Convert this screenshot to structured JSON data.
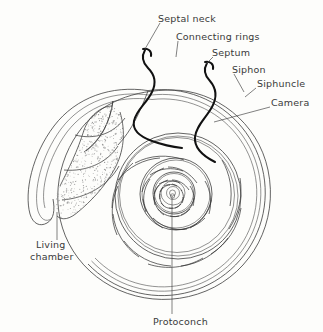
{
  "figure": {
    "background_color": "#fdfdfb",
    "line_color": "#3c3c3c",
    "bold_line_color": "#111111",
    "text_color": "#3a3a3a",
    "stipple_color": "#9a9a9a"
  },
  "labels": {
    "septal_neck": "Septal neck",
    "connecting_rings": "Connecting rings",
    "septum": "Septum",
    "siphon": "Siphon",
    "siphuncle": "Siphuncle",
    "camera": "Camera",
    "living_chamber_line1": "Living",
    "living_chamber_line2": "chamber",
    "protoconch": "Protoconch"
  },
  "diagram_data": {
    "type": "labeled-anatomical-diagram",
    "subject": "Nautilus shell median section",
    "center": [
      172,
      193
    ],
    "outer_radius": 103,
    "spiral": {
      "form": "logarithmic",
      "growth_per_turn": 3.1,
      "turns_visible": 3.6
    },
    "callouts": [
      {
        "label": "Septal neck",
        "text_xy": [
          158,
          19
        ],
        "anchor_xy": [
          146,
          48
        ]
      },
      {
        "label": "Connecting rings",
        "text_xy": [
          176,
          37
        ],
        "anchor_xy": [
          176,
          57
        ]
      },
      {
        "label": "Septum",
        "text_xy": [
          212,
          53
        ],
        "anchor_xy": [
          205,
          64
        ]
      },
      {
        "label": "Siphon",
        "text_xy": [
          233,
          70
        ],
        "anchor_xy": [
          243,
          90
        ]
      },
      {
        "label": "Siphuncle",
        "text_xy": [
          258,
          90
        ],
        "anchor_xy": [
          246,
          98
        ]
      },
      {
        "label": "Camera",
        "text_xy": [
          272,
          110
        ],
        "anchor_xy": [
          214,
          122
        ]
      },
      {
        "label": "Living chamber",
        "text_xy": [
          36,
          247
        ],
        "anchor_xy": [
          57,
          212
        ]
      },
      {
        "label": "Protoconch",
        "text_xy": [
          154,
          322
        ],
        "anchor_xy": [
          172,
          196
        ]
      }
    ]
  }
}
